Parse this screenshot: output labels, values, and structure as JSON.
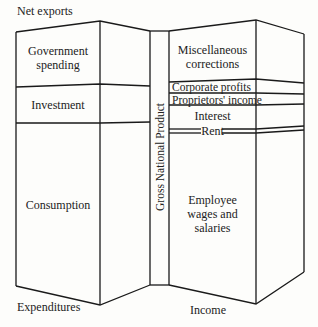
{
  "diagram": {
    "type": "two-column block diagram",
    "center_label": "Gross National Product",
    "expenditures": {
      "title": "Expenditures",
      "top_label": "Net exports",
      "segments": [
        {
          "label_line1": "Government",
          "label_line2": "spending"
        },
        {
          "label": "Investment"
        },
        {
          "label": "Consumption"
        }
      ]
    },
    "income": {
      "title": "Income",
      "segments": [
        {
          "label_line1": "Miscellaneous",
          "label_line2": "corrections"
        },
        {
          "label": "Corporate profits"
        },
        {
          "label": "Proprietors' income"
        },
        {
          "label": "Interest"
        },
        {
          "label": "Rent"
        },
        {
          "label_line1": "Employee",
          "label_line2": "wages and",
          "label_line3": "salaries"
        }
      ]
    },
    "colors": {
      "line": "#1a1a1a",
      "background": "#fdfdfb"
    }
  }
}
